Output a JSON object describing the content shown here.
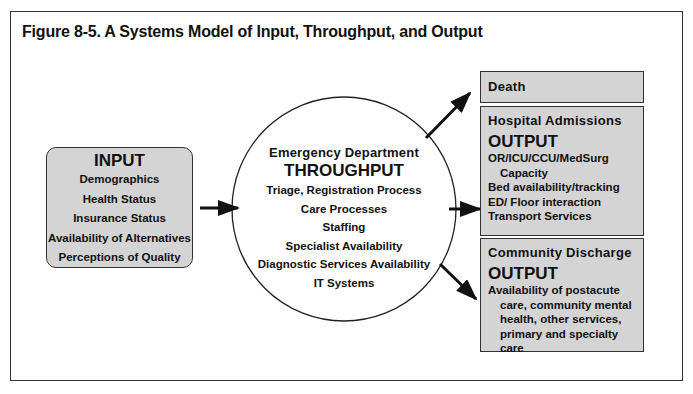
{
  "figure": {
    "title": "Figure 8-5. A Systems Model of Input, Throughput, and Output"
  },
  "input": {
    "heading": "INPUT",
    "items": [
      "Demographics",
      "Health Status",
      "Insurance Status",
      "Availability of Alternatives",
      "Perceptions of Quality"
    ]
  },
  "throughput": {
    "subtitle": "Emergency Department",
    "heading": "THROUGHPUT",
    "items": [
      "Triage, Registration Process",
      "Care Processes",
      "Staffing",
      "Specialist Availability",
      "Diagnostic Services Availability",
      "IT Systems"
    ]
  },
  "outputs": {
    "death": {
      "label": "Death"
    },
    "hospital_admissions": {
      "label": "Hospital Admissions",
      "heading": "OUTPUT",
      "items": [
        "OR/ICU/CCU/MedSurg",
        "Capacity",
        "Bed availability/tracking",
        "ED/ Floor interaction",
        "Transport Services"
      ]
    },
    "community_discharge": {
      "label": "Community Discharge",
      "heading": "OUTPUT",
      "items": [
        "Availability of postacute",
        "care, community mental",
        "health, other services,",
        "primary and specialty care"
      ]
    }
  },
  "colors": {
    "box_fill": "#d4d4d4",
    "stroke": "#333333",
    "text": "#111111"
  }
}
